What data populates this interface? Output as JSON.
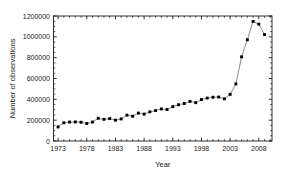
{
  "chart_data": {
    "type": "line",
    "title": "",
    "xlabel": "Year",
    "ylabel": "Number of observations",
    "xlim": [
      1972.2,
      2010.3
    ],
    "ylim": [
      0,
      1200000
    ],
    "grid": false,
    "legend": null,
    "marker": "filled-square",
    "x_ticklabels": [
      "1973",
      "1978",
      "1983",
      "1988",
      "1993",
      "1998",
      "2003",
      "2008"
    ],
    "x_tickvalues": [
      1973,
      1978,
      1983,
      1988,
      1993,
      1998,
      2003,
      2008
    ],
    "x_minor_tick_step": 1,
    "y_ticklabels": [
      "0",
      "200000",
      "400000",
      "600000",
      "800000",
      "1000000",
      "1200000"
    ],
    "y_tickvalues": [
      0,
      200000,
      400000,
      600000,
      800000,
      1000000,
      1200000
    ],
    "y_minor_tick_step": 50000,
    "x": [
      1973,
      1974,
      1975,
      1976,
      1977,
      1978,
      1979,
      1980,
      1981,
      1982,
      1983,
      1984,
      1985,
      1986,
      1987,
      1988,
      1989,
      1990,
      1991,
      1992,
      1993,
      1994,
      1995,
      1996,
      1997,
      1998,
      1999,
      2000,
      2001,
      2002,
      2003,
      2004,
      2005,
      2006,
      2007,
      2008,
      2009
    ],
    "values": [
      135000,
      175000,
      182000,
      183000,
      180000,
      168000,
      182000,
      218000,
      208000,
      215000,
      200000,
      212000,
      248000,
      238000,
      268000,
      258000,
      280000,
      292000,
      308000,
      302000,
      330000,
      348000,
      360000,
      380000,
      368000,
      398000,
      412000,
      420000,
      422000,
      405000,
      448000,
      548000,
      808000,
      972000,
      1148000,
      1122000,
      1022000
    ],
    "series_name": "Number of observations"
  },
  "axis": {
    "xlabel": "Year",
    "ylabel": "Number of observations"
  }
}
